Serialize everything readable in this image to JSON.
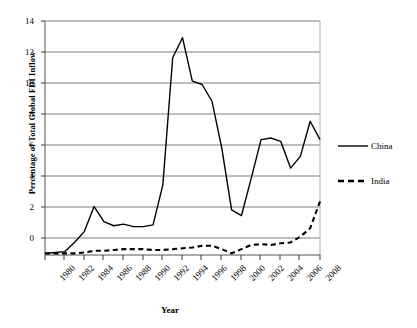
{
  "chart_data": {
    "type": "line",
    "title": "",
    "xlabel": "Year",
    "ylabel": "Percentage of Total Global FDI Inflow",
    "xlim": [
      1980,
      2008
    ],
    "ylim": [
      0,
      14
    ],
    "yticks": [
      "0",
      "2",
      "4",
      "6",
      "8",
      "10",
      "12",
      "14"
    ],
    "xticks": [
      "1980",
      "1982",
      "1984",
      "1986",
      "1988",
      "1990",
      "1992",
      "1994",
      "1996",
      "1998",
      "2000",
      "2002",
      "2004",
      "2006",
      "2008"
    ],
    "grid": "horizontal",
    "legend_position": "right",
    "x": [
      1980,
      1981,
      1982,
      1983,
      1984,
      1985,
      1986,
      1987,
      1988,
      1989,
      1990,
      1991,
      1992,
      1993,
      1994,
      1995,
      1996,
      1997,
      1998,
      1999,
      2000,
      2001,
      2002,
      2003,
      2004,
      2005,
      2006,
      2007,
      2008
    ],
    "series": [
      {
        "name": "China",
        "style": "solid",
        "color": "#000000",
        "values": [
          0.1,
          0.15,
          0.2,
          0.75,
          1.4,
          2.9,
          2.0,
          1.75,
          1.85,
          1.7,
          1.7,
          1.8,
          4.2,
          11.8,
          13.0,
          10.4,
          10.2,
          9.2,
          6.4,
          2.7,
          2.35,
          4.6,
          6.9,
          7.0,
          6.8,
          5.2,
          5.9,
          8.0,
          6.9
        ]
      },
      {
        "name": "India",
        "style": "dashed",
        "color": "#000000",
        "values": [
          0.1,
          0.1,
          0.1,
          0.1,
          0.15,
          0.25,
          0.25,
          0.3,
          0.35,
          0.35,
          0.35,
          0.3,
          0.3,
          0.35,
          0.4,
          0.45,
          0.55,
          0.55,
          0.35,
          0.1,
          0.35,
          0.6,
          0.65,
          0.6,
          0.7,
          0.75,
          1.1,
          1.6,
          3.2
        ]
      }
    ]
  },
  "legend": {
    "items": [
      {
        "label": "China"
      },
      {
        "label": "India"
      }
    ]
  }
}
